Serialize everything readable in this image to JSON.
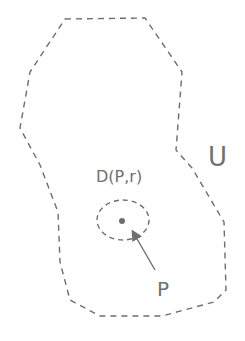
{
  "diagram": {
    "region_label": "U",
    "disk_label": "D(P,r)",
    "point_label": "P",
    "colors": {
      "stroke": "#6e6e6e",
      "text": "#707070",
      "background": "#ffffff"
    }
  }
}
